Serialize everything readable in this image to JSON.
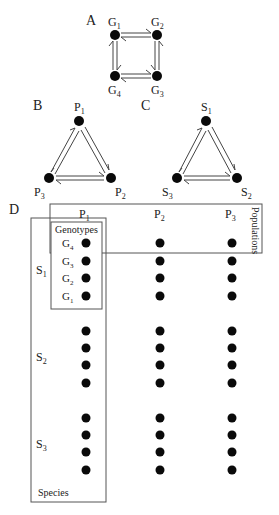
{
  "panels": {
    "A": {
      "label": "A",
      "nodes": [
        {
          "id": "G1",
          "base": "G",
          "sub": "1"
        },
        {
          "id": "G2",
          "base": "G",
          "sub": "2"
        },
        {
          "id": "G3",
          "base": "G",
          "sub": "3"
        },
        {
          "id": "G4",
          "base": "G",
          "sub": "4"
        }
      ],
      "edges": [
        [
          "G1",
          "G2"
        ],
        [
          "G2",
          "G3"
        ],
        [
          "G3",
          "G4"
        ],
        [
          "G4",
          "G1"
        ]
      ],
      "edge_style": "bidirectional-double-arrow"
    },
    "B": {
      "label": "B",
      "nodes": [
        {
          "id": "P1",
          "base": "P",
          "sub": "1"
        },
        {
          "id": "P2",
          "base": "P",
          "sub": "2"
        },
        {
          "id": "P3",
          "base": "P",
          "sub": "3"
        }
      ],
      "edges": [
        [
          "P1",
          "P2"
        ],
        [
          "P2",
          "P3"
        ],
        [
          "P3",
          "P1"
        ]
      ],
      "edge_style": "bidirectional-double-arrow"
    },
    "C": {
      "label": "C",
      "nodes": [
        {
          "id": "S1",
          "base": "S",
          "sub": "1"
        },
        {
          "id": "S2",
          "base": "S",
          "sub": "2"
        },
        {
          "id": "S3",
          "base": "S",
          "sub": "3"
        }
      ],
      "edges": [
        [
          "S1",
          "S2"
        ],
        [
          "S2",
          "S3"
        ],
        [
          "S3",
          "S1"
        ]
      ],
      "edge_style": "bidirectional-double-arrow"
    },
    "D": {
      "label": "D",
      "populations_box_label": "Populations",
      "species_box_label": "Species",
      "genotypes_box_label": "Genotypes",
      "columns": [
        {
          "base": "P",
          "sub": "1"
        },
        {
          "base": "P",
          "sub": "2"
        },
        {
          "base": "P",
          "sub": "3"
        }
      ],
      "species_rows": [
        {
          "base": "S",
          "sub": "1"
        },
        {
          "base": "S",
          "sub": "2"
        },
        {
          "base": "S",
          "sub": "3"
        }
      ],
      "genotype_labels": [
        {
          "base": "G",
          "sub": "4"
        },
        {
          "base": "G",
          "sub": "3"
        },
        {
          "base": "G",
          "sub": "2"
        },
        {
          "base": "G",
          "sub": "1"
        }
      ],
      "dots_per_cell": 4
    }
  },
  "colors": {
    "dot": "#0a0a0a",
    "line": "#555555",
    "text": "#222222"
  }
}
